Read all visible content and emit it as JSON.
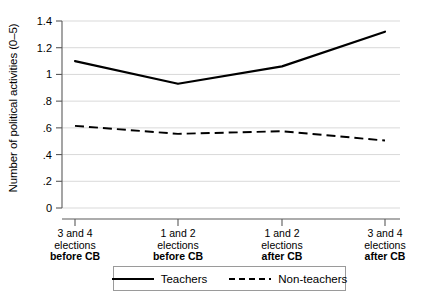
{
  "chart_data": {
    "type": "line",
    "title": "",
    "xlabel": "",
    "ylabel": "Number of political activities (0–5)",
    "categories": [
      "3 and 4 elections before CB",
      "1 and 2 elections before CB",
      "1 and 2 elections after CB",
      "3 and 4 elections after CB"
    ],
    "x": [
      1,
      2,
      3,
      4
    ],
    "ylim": [
      0,
      1.4
    ],
    "yticks": [
      0,
      0.2,
      0.4,
      0.6,
      0.8,
      1,
      1.2,
      1.4
    ],
    "ytick_labels": [
      "0",
      ".2",
      ".4",
      ".6",
      ".8",
      "1",
      "1.2",
      "1.4"
    ],
    "grid": true,
    "grid_axis": "y",
    "legend_position": "bottom",
    "series": [
      {
        "name": "Teachers",
        "style": "solid",
        "color": "#000000",
        "values": [
          1.1,
          0.93,
          1.06,
          1.32
        ]
      },
      {
        "name": "Non-teachers",
        "style": "dashed",
        "color": "#000000",
        "values": [
          0.615,
          0.555,
          0.575,
          0.505
        ]
      }
    ]
  },
  "axis": {
    "y_title": "Number of political activities (0–5)",
    "y_tick_labels": [
      "1.4",
      "1.2",
      "1",
      ".8",
      ".6",
      ".4",
      ".2",
      "0"
    ],
    "x_categories": [
      {
        "line1": "3 and 4",
        "line2": "elections",
        "line3": "before CB"
      },
      {
        "line1": "1 and 2",
        "line2": "elections",
        "line3": "before CB"
      },
      {
        "line1": "1 and 2",
        "line2": "elections",
        "line3": "after CB"
      },
      {
        "line1": "3 and 4",
        "line2": "elections",
        "line3": "after CB"
      }
    ]
  },
  "legend": {
    "items": [
      {
        "label": "Teachers",
        "style": "solid"
      },
      {
        "label": "Non-teachers",
        "style": "dashed"
      }
    ]
  },
  "colors": {
    "line": "#000000",
    "grid": "#d9d9d9",
    "axis": "#5a5a5a",
    "legend_border": "#9a9a9a",
    "background": "#ffffff"
  }
}
